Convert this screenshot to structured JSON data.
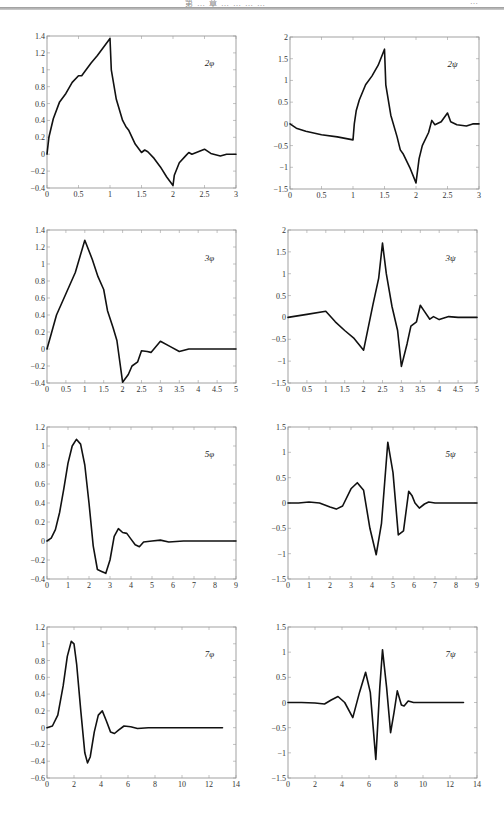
{
  "page": {
    "header_left_text": "第 … 章 … … … …",
    "header_right_text": "…"
  },
  "chart_data": [
    {
      "id": "p2phi",
      "type": "line",
      "label": "2φ",
      "xlim": [
        0,
        3
      ],
      "ylim": [
        -0.4,
        1.4
      ],
      "xticks": [
        0,
        0.5,
        1,
        1.5,
        2,
        2.5,
        3
      ],
      "yticks": [
        -0.4,
        -0.2,
        0,
        0.2,
        0.4,
        0.6,
        0.8,
        1,
        1.2,
        1.4
      ],
      "x": [
        0,
        0.03,
        0.1,
        0.2,
        0.3,
        0.4,
        0.5,
        0.55,
        0.6,
        0.7,
        0.8,
        0.9,
        1.0,
        1.02,
        1.1,
        1.2,
        1.25,
        1.3,
        1.4,
        1.5,
        1.55,
        1.6,
        1.7,
        1.8,
        1.9,
        2.0,
        2.02,
        2.1,
        2.2,
        2.25,
        2.3,
        2.4,
        2.5,
        2.6,
        2.75,
        2.85,
        3.0
      ],
      "y": [
        0,
        0.2,
        0.42,
        0.62,
        0.72,
        0.85,
        0.93,
        0.93,
        0.98,
        1.08,
        1.17,
        1.27,
        1.37,
        1.0,
        0.65,
        0.4,
        0.33,
        0.28,
        0.12,
        0.02,
        0.05,
        0.03,
        -0.05,
        -0.15,
        -0.27,
        -0.37,
        -0.25,
        -0.1,
        -0.02,
        0.02,
        0.0,
        0.03,
        0.06,
        0.01,
        -0.02,
        0.0,
        0.0
      ]
    },
    {
      "id": "p2psi",
      "type": "line",
      "label": "2ψ",
      "xlim": [
        0,
        3
      ],
      "ylim": [
        -1.5,
        2
      ],
      "xticks": [
        0,
        0.5,
        1,
        1.5,
        2,
        2.5,
        3
      ],
      "yticks": [
        -1.5,
        -1,
        -0.5,
        0,
        0.5,
        1,
        1.5,
        2
      ],
      "x": [
        0,
        0.1,
        0.25,
        0.5,
        0.75,
        1.0,
        1.02,
        1.05,
        1.1,
        1.2,
        1.3,
        1.4,
        1.5,
        1.52,
        1.6,
        1.7,
        1.75,
        1.8,
        1.9,
        2.0,
        2.05,
        2.1,
        2.2,
        2.25,
        2.3,
        2.4,
        2.5,
        2.55,
        2.65,
        2.8,
        2.9,
        3.0
      ],
      "y": [
        0,
        -0.1,
        -0.17,
        -0.25,
        -0.3,
        -0.37,
        0.0,
        0.3,
        0.55,
        0.9,
        1.1,
        1.35,
        1.72,
        0.9,
        0.2,
        -0.3,
        -0.6,
        -0.7,
        -1.0,
        -1.36,
        -0.8,
        -0.5,
        -0.2,
        0.08,
        -0.02,
        0.05,
        0.25,
        0.05,
        -0.02,
        -0.05,
        0.0,
        0.0
      ]
    },
    {
      "id": "p3phi",
      "type": "line",
      "label": "3φ",
      "xlim": [
        0,
        5
      ],
      "ylim": [
        -0.4,
        1.4
      ],
      "xticks": [
        0,
        0.5,
        1,
        1.5,
        2,
        2.5,
        3,
        3.5,
        4,
        4.5,
        5
      ],
      "yticks": [
        -0.4,
        -0.2,
        0,
        0.2,
        0.4,
        0.6,
        0.8,
        1,
        1.2,
        1.4
      ],
      "x": [
        0,
        0.25,
        0.5,
        0.75,
        1.0,
        1.2,
        1.35,
        1.5,
        1.6,
        1.75,
        1.85,
        2.0,
        2.15,
        2.25,
        2.4,
        2.5,
        2.65,
        2.75,
        3.0,
        3.25,
        3.5,
        3.75,
        4.0,
        4.5,
        5.0
      ],
      "y": [
        0,
        0.4,
        0.65,
        0.9,
        1.28,
        1.05,
        0.85,
        0.7,
        0.45,
        0.25,
        0.1,
        -0.39,
        -0.3,
        -0.2,
        -0.15,
        -0.02,
        -0.03,
        -0.04,
        0.09,
        0.03,
        -0.03,
        0.0,
        0.0,
        0.0,
        0.0
      ]
    },
    {
      "id": "p3psi",
      "type": "line",
      "label": "3ψ",
      "xlim": [
        0,
        5
      ],
      "ylim": [
        -1.5,
        2
      ],
      "xticks": [
        0,
        0.5,
        1,
        1.5,
        2,
        2.5,
        3,
        3.5,
        4,
        4.5,
        5
      ],
      "yticks": [
        -1.5,
        -1,
        -0.5,
        0,
        0.5,
        1,
        1.5,
        2
      ],
      "x": [
        0,
        0.5,
        1.0,
        1.25,
        1.5,
        1.75,
        2.0,
        2.25,
        2.4,
        2.5,
        2.6,
        2.75,
        2.9,
        3.0,
        3.15,
        3.25,
        3.4,
        3.5,
        3.6,
        3.75,
        3.85,
        4.0,
        4.25,
        4.5,
        5.0
      ],
      "y": [
        0,
        0.07,
        0.14,
        -0.1,
        -0.3,
        -0.48,
        -0.75,
        0.3,
        0.9,
        1.7,
        1.0,
        0.25,
        -0.3,
        -1.12,
        -0.6,
        -0.2,
        -0.1,
        0.28,
        0.15,
        -0.04,
        0.02,
        -0.05,
        0.02,
        0.0,
        0.0
      ]
    },
    {
      "id": "p5phi",
      "type": "line",
      "label": "5φ",
      "xlim": [
        0,
        9
      ],
      "ylim": [
        -0.4,
        1.2
      ],
      "xticks": [
        0,
        1,
        2,
        3,
        4,
        5,
        6,
        7,
        8,
        9
      ],
      "yticks": [
        -0.4,
        -0.2,
        0,
        0.2,
        0.4,
        0.6,
        0.8,
        1,
        1.2
      ],
      "x": [
        0,
        0.2,
        0.4,
        0.6,
        0.8,
        1.0,
        1.2,
        1.4,
        1.6,
        1.8,
        2.0,
        2.2,
        2.4,
        2.6,
        2.8,
        3.0,
        3.2,
        3.4,
        3.6,
        3.8,
        4.0,
        4.2,
        4.4,
        4.6,
        5.0,
        5.4,
        5.8,
        6.5,
        9.0
      ],
      "y": [
        0,
        0.03,
        0.12,
        0.3,
        0.55,
        0.82,
        1.0,
        1.07,
        1.02,
        0.8,
        0.4,
        -0.05,
        -0.3,
        -0.32,
        -0.34,
        -0.2,
        0.05,
        0.13,
        0.09,
        0.08,
        0.02,
        -0.04,
        -0.06,
        -0.01,
        0.0,
        0.01,
        -0.01,
        0.0,
        0.0
      ]
    },
    {
      "id": "p5psi",
      "type": "line",
      "label": "5ψ",
      "xlim": [
        0,
        9
      ],
      "ylim": [
        -1.5,
        1.5
      ],
      "xticks": [
        0,
        1,
        2,
        3,
        4,
        5,
        6,
        7,
        8,
        9
      ],
      "yticks": [
        -1.5,
        -1,
        -0.5,
        0,
        0.5,
        1,
        1.5
      ],
      "x": [
        0,
        0.5,
        1.0,
        1.5,
        2.0,
        2.3,
        2.6,
        3.0,
        3.3,
        3.6,
        3.9,
        4.2,
        4.45,
        4.75,
        5.0,
        5.25,
        5.5,
        5.75,
        5.9,
        6.05,
        6.25,
        6.5,
        6.7,
        7.0,
        9.0
      ],
      "y": [
        0,
        0.0,
        0.02,
        0.0,
        -0.08,
        -0.12,
        -0.06,
        0.28,
        0.4,
        0.25,
        -0.5,
        -1.02,
        -0.4,
        1.2,
        0.6,
        -0.63,
        -0.55,
        0.23,
        0.15,
        0.0,
        -0.1,
        -0.02,
        0.02,
        0.0,
        0.0
      ]
    },
    {
      "id": "p7phi",
      "type": "line",
      "label": "7φ",
      "xlim": [
        0,
        14
      ],
      "ylim": [
        -0.6,
        1.2
      ],
      "xticks": [
        0,
        2,
        4,
        6,
        8,
        10,
        12,
        14
      ],
      "yticks": [
        -0.6,
        -0.4,
        -0.2,
        0,
        0.2,
        0.4,
        0.6,
        0.8,
        1,
        1.2
      ],
      "x": [
        0,
        0.4,
        0.8,
        1.2,
        1.5,
        1.8,
        2.0,
        2.2,
        2.5,
        2.8,
        3.0,
        3.2,
        3.5,
        3.8,
        4.1,
        4.4,
        4.7,
        5.0,
        5.3,
        5.7,
        6.2,
        6.7,
        7.5,
        9,
        13
      ],
      "y": [
        0,
        0.02,
        0.15,
        0.5,
        0.85,
        1.03,
        1.0,
        0.75,
        0.2,
        -0.3,
        -0.42,
        -0.35,
        -0.05,
        0.15,
        0.2,
        0.08,
        -0.05,
        -0.07,
        -0.03,
        0.02,
        0.01,
        -0.01,
        0.0,
        0.0,
        0.0
      ]
    },
    {
      "id": "p7psi",
      "type": "line",
      "label": "7ψ",
      "xlim": [
        0,
        14
      ],
      "ylim": [
        -1.5,
        1.5
      ],
      "xticks": [
        0,
        2,
        4,
        6,
        8,
        10,
        12,
        14
      ],
      "yticks": [
        -1.5,
        -1,
        -0.5,
        0,
        0.5,
        1,
        1.5
      ],
      "x": [
        0,
        1.0,
        2.0,
        2.7,
        3.2,
        3.7,
        4.2,
        4.8,
        5.3,
        5.75,
        6.1,
        6.5,
        6.8,
        7.0,
        7.3,
        7.6,
        7.85,
        8.1,
        8.4,
        8.6,
        8.9,
        9.3,
        10,
        13
      ],
      "y": [
        0,
        0.0,
        -0.01,
        -0.03,
        0.05,
        0.12,
        0.0,
        -0.3,
        0.2,
        0.6,
        0.2,
        -1.13,
        0.3,
        1.05,
        0.3,
        -0.6,
        -0.2,
        0.23,
        -0.05,
        -0.07,
        0.03,
        0.0,
        0.0,
        0.0
      ]
    }
  ]
}
